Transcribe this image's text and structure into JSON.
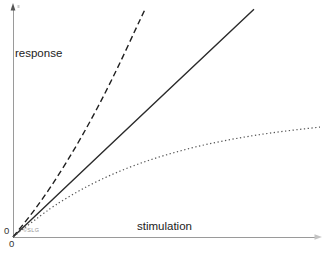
{
  "chart_data": {
    "type": "line",
    "title": "",
    "xlabel": "stimulation",
    "ylabel": "response",
    "x_zero_label": "0",
    "y_zero_label": "0",
    "watermark": "©SLG",
    "xlim": [
      0,
      1
    ],
    "ylim": [
      0,
      1
    ],
    "grid": false,
    "legend": "none",
    "series": [
      {
        "name": "accelerating response",
        "style": "dashed",
        "color": "#1f1f1f",
        "points": [
          [
            0,
            0
          ],
          [
            0.05,
            0.082
          ],
          [
            0.1,
            0.173
          ],
          [
            0.15,
            0.274
          ],
          [
            0.2,
            0.383
          ],
          [
            0.25,
            0.501
          ],
          [
            0.3,
            0.628
          ],
          [
            0.35,
            0.764
          ],
          [
            0.4,
            0.909
          ],
          [
            0.432,
            1.0
          ]
        ]
      },
      {
        "name": "linear response",
        "style": "solid",
        "color": "#2a2a2a",
        "points": [
          [
            0,
            0
          ],
          [
            0.2,
            0.254
          ],
          [
            0.4,
            0.507
          ],
          [
            0.6,
            0.761
          ],
          [
            0.785,
            0.995
          ]
        ]
      },
      {
        "name": "saturating response",
        "style": "dotted",
        "color": "#555555",
        "points": [
          [
            0,
            0
          ],
          [
            0.1,
            0.107
          ],
          [
            0.2,
            0.192
          ],
          [
            0.3,
            0.261
          ],
          [
            0.4,
            0.316
          ],
          [
            0.5,
            0.36
          ],
          [
            0.6,
            0.396
          ],
          [
            0.7,
            0.424
          ],
          [
            0.8,
            0.447
          ],
          [
            0.9,
            0.465
          ],
          [
            1.0,
            0.48
          ]
        ]
      }
    ],
    "colors": {
      "axis": "#9a9a9a",
      "arrow": "#555555",
      "faint_arrow": "#c4c4c4",
      "text": "#222222",
      "watermark": "#949494"
    }
  }
}
